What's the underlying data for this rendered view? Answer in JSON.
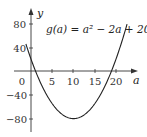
{
  "chart_data": {
    "type": "line",
    "title": "",
    "equation_label": "g(a) = a² − 2a + 20",
    "xlabel": "a",
    "ylabel": "y",
    "x_ticks": [
      0,
      5,
      10,
      15,
      20
    ],
    "x_tick_labels": [
      "0",
      "5",
      "10",
      "15",
      "20"
    ],
    "y_ticks": [
      80,
      40,
      -40,
      -80
    ],
    "y_tick_labels": [
      "80",
      "40",
      "−40",
      "−80"
    ],
    "xlim": [
      -2,
      24
    ],
    "ylim": [
      -90,
      100
    ],
    "grid": false,
    "legend": "none",
    "series": [
      {
        "name": "g(a)",
        "x": [
          -2,
          0,
          1,
          2,
          5,
          8,
          10,
          12,
          15,
          18,
          19,
          20,
          22,
          23
        ],
        "values": [
          64,
          20,
          1,
          -16,
          -55,
          -76,
          -80,
          -76,
          -55,
          -16,
          1,
          20,
          64,
          89
        ]
      }
    ],
    "annotations": [
      {
        "text": "g(a) = a² − 2a + 20",
        "position": "upper-center"
      }
    ]
  }
}
